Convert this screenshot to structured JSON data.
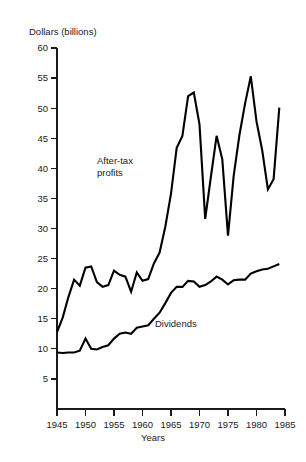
{
  "chart_data": {
    "type": "line",
    "title": "",
    "ylabel": "Dollars (billions)",
    "xlabel": "Years",
    "xlim": [
      1945,
      1985
    ],
    "ylim": [
      0,
      60
    ],
    "ytick_step": 5,
    "xtick_step": 5,
    "grid": false,
    "legend_position": "inline-annotations",
    "yticks": [
      5,
      10,
      15,
      20,
      25,
      30,
      35,
      40,
      45,
      50,
      55,
      60
    ],
    "ytick_labels": [
      "5",
      "10",
      "15",
      "20",
      "25",
      "30",
      "35",
      "40",
      "45",
      "50",
      "55",
      "60"
    ],
    "xticks": [
      1945,
      1950,
      1955,
      1960,
      1965,
      1970,
      1975,
      1980,
      1985
    ],
    "xtick_labels": [
      "1945",
      "1950",
      "1955",
      "1960",
      "1965",
      "1970",
      "1975",
      "1980",
      "1985"
    ],
    "line_color": "#000000",
    "series": [
      {
        "name": "After-tax profits",
        "label_position": {
          "x": 97,
          "y": 155
        },
        "x": [
          1945,
          1946,
          1947,
          1948,
          1949,
          1950,
          1951,
          1952,
          1953,
          1954,
          1955,
          1956,
          1957,
          1958,
          1959,
          1960,
          1961,
          1962,
          1963,
          1964,
          1965,
          1966,
          1967,
          1968,
          1969,
          1970,
          1971,
          1972,
          1973,
          1974,
          1975,
          1976,
          1977,
          1978,
          1979,
          1980,
          1981,
          1982,
          1983,
          1984
        ],
        "values": [
          12.8,
          15.2,
          18.6,
          21.5,
          20.5,
          23.5,
          23.7,
          21.1,
          20.3,
          20.6,
          23.0,
          22.3,
          22.0,
          19.5,
          22.7,
          21.3,
          21.6,
          24.2,
          26.0,
          30.3,
          35.8,
          43.4,
          45.4,
          52.0,
          52.6,
          47.3,
          31.6,
          38.6,
          45.4,
          41.5,
          28.8,
          38.8,
          45.5,
          50.8,
          55.3,
          47.8,
          43.0,
          36.5,
          38.2,
          50.1
        ]
      },
      {
        "name": "Dividends",
        "label_position": {
          "x": 155,
          "y": 318
        },
        "x": [
          1945,
          1946,
          1947,
          1948,
          1949,
          1950,
          1951,
          1952,
          1953,
          1954,
          1955,
          1956,
          1957,
          1958,
          1959,
          1960,
          1961,
          1962,
          1963,
          1964,
          1965,
          1966,
          1967,
          1968,
          1969,
          1970,
          1971,
          1972,
          1973,
          1974,
          1975,
          1976,
          1977,
          1978,
          1979,
          1980,
          1981,
          1982,
          1983,
          1984
        ],
        "values": [
          9.4,
          9.3,
          9.4,
          9.4,
          9.7,
          11.7,
          10.0,
          9.9,
          10.3,
          10.6,
          11.7,
          12.5,
          12.7,
          12.5,
          13.5,
          13.7,
          13.9,
          15.0,
          16.0,
          17.6,
          19.3,
          20.3,
          20.3,
          21.3,
          21.2,
          20.3,
          20.6,
          21.2,
          22.0,
          21.5,
          20.7,
          21.4,
          21.5,
          21.5,
          22.5,
          22.9,
          23.2,
          23.3,
          23.7,
          24.1
        ]
      }
    ]
  },
  "annotations": {
    "profits_line1": "After-tax",
    "profits_line2": "profits",
    "dividends": "Dividends"
  }
}
